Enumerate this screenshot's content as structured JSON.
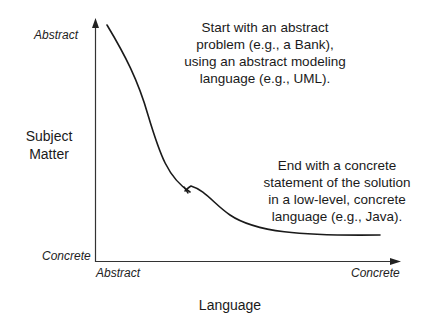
{
  "diagram": {
    "y_axis": {
      "title_lines": [
        "Subject",
        "Matter"
      ],
      "top_label": "Abstract",
      "bottom_label": "Concrete"
    },
    "x_axis": {
      "title": "Language",
      "left_label": "Abstract",
      "right_label": "Concrete"
    },
    "annotations": {
      "start": [
        "Start with an abstract",
        "problem (e.g., a Bank),",
        "using an abstract modeling",
        "language (e.g., UML)."
      ],
      "end": [
        "End with a concrete",
        "statement of the solution",
        "in a low-level, concrete",
        "language (e.g., Java)."
      ]
    },
    "colors": {
      "line": "#1a1a1a",
      "axis": "#333333",
      "background": "#ffffff"
    }
  }
}
